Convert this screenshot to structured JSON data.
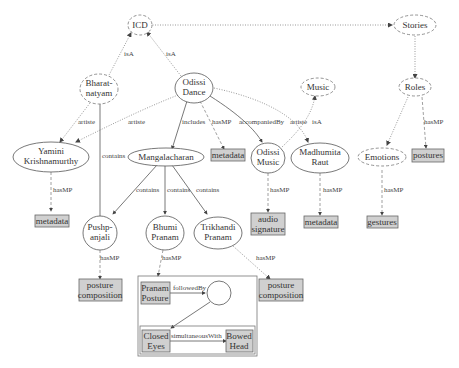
{
  "nodes": {
    "icd": "ICD",
    "stories": "Stories",
    "bharatnatyam_1": "Bharat-",
    "bharatnatyam_2": "natyam",
    "odissi_dance_1": "Odissi",
    "odissi_dance_2": "Dance",
    "music": "Music",
    "roles": "Roles",
    "yamini_1": "Yamini",
    "yamini_2": "Krishnamurthy",
    "mangalacharan": "Mangalacharan",
    "metadata_odissi": "metadata",
    "odissi_music_1": "Odissi",
    "odissi_music_2": "Music",
    "madhumita_1": "Madhumita",
    "madhumita_2": "Raut",
    "emotions": "Emotions",
    "postures": "postures",
    "metadata_yamini": "metadata",
    "pushpanjali_1": "Pushp-",
    "pushpanjali_2": "anjali",
    "bhumi_1": "Bhumi",
    "bhumi_2": "Pranam",
    "trikhandi_1": "Trikhandi",
    "trikhandi_2": "Pranam",
    "audio_1": "audio",
    "audio_2": "signature",
    "metadata_madhumita": "metadata",
    "gestures": "gestures",
    "posture_comp_left_1": "posture",
    "posture_comp_left_2": "composition",
    "posture_comp_right_1": "posture",
    "posture_comp_right_2": "composition",
    "pranam_posture_1": "Pranam",
    "pranam_posture_2": "Posture",
    "closed_eyes_1": "Closed",
    "closed_eyes_2": "Eyes",
    "bowed_head_1": "Bowed",
    "bowed_head_2": "Head"
  },
  "edges": {
    "isA_bharat": "isA",
    "isA_odissi": "isA",
    "artiste_bharat": "artiste",
    "artiste_odissi": "artiste",
    "contains_bharat": "contains",
    "includes": "includes",
    "hasMP_odissi": "hasMP",
    "accompaniedBy": "accompaniedBy",
    "artiste_madhumita": "artiste",
    "isA_music": "isA",
    "hasMP_roles": "hasMP",
    "hasMP_yamini": "hasMP",
    "contains_1": "contains",
    "contains_2": "contains",
    "contains_3": "contains",
    "hasMP_odissi_music": "hasMP",
    "hasMP_madhumita": "hasMP",
    "hasMP_emotions": "hasMP",
    "hasMP_pushpanjali": "hasMP",
    "hasMP_bhumi": "hasMP",
    "hasMP_trikhandi": "hasMP",
    "followedBy": "followedBy",
    "simultaneousWith": "simultaneousWith"
  }
}
